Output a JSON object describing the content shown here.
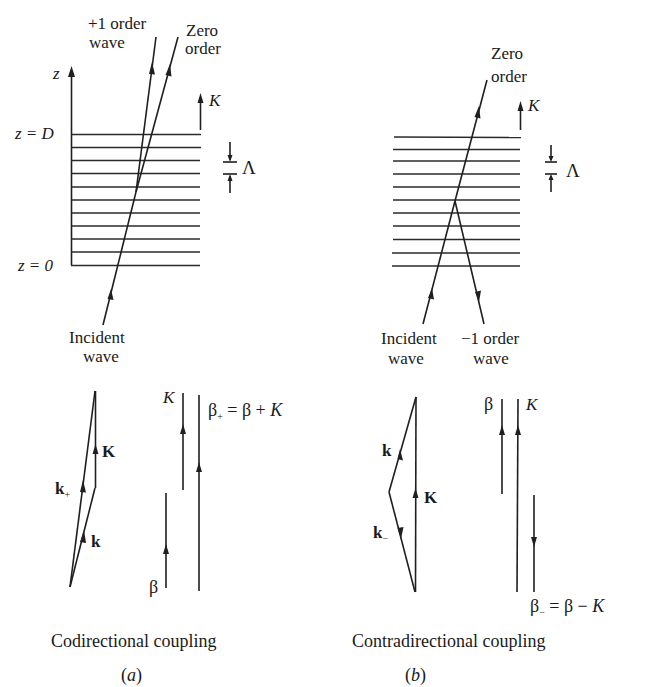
{
  "figure": {
    "panel_a": {
      "grating": {
        "axis_label": "z",
        "top_label": "z = D",
        "bottom_label": "z = 0",
        "grating_vector_label": "K",
        "period_label": "Λ",
        "line_count": 11
      },
      "rays": {
        "plus_one_label_line1": "+1 order",
        "plus_one_label_line2": "wave",
        "zero_label_line1": "Zero",
        "zero_label_line2": "order",
        "incident_label_line1": "Incident",
        "incident_label_line2": "wave"
      },
      "wavevector_diagram": {
        "K_label": "K",
        "k_plus_label": "k",
        "k_plus_sub": "+",
        "k_label": "k"
      },
      "propagation_constants": {
        "K_label": "K",
        "beta_label": "β",
        "beta_plus_eq": "β",
        "beta_plus_sub": "+",
        "beta_plus_rhs": " = β + ",
        "beta_plus_K": "K"
      },
      "caption": "Codirectional coupling",
      "tag": "(a)",
      "tag_open": "(",
      "tag_letter": "a",
      "tag_close": ")"
    },
    "panel_b": {
      "grating": {
        "grating_vector_label": "K",
        "period_label": "Λ",
        "line_count": 11
      },
      "rays": {
        "zero_label_line1": "Zero",
        "zero_label_line2": "order",
        "incident_label_line1": "Incident",
        "incident_label_line2": "wave",
        "minus_one_label_line1": "−1 order",
        "minus_one_label_line2": "wave"
      },
      "wavevector_diagram": {
        "k_label": "k",
        "K_label": "K",
        "k_minus_label": "k",
        "k_minus_sub": "−"
      },
      "propagation_constants": {
        "beta_label": "β",
        "K_label": "K",
        "beta_minus_eq": "β",
        "beta_minus_sub": "−",
        "beta_minus_rhs": " = β − ",
        "beta_minus_K": "K"
      },
      "caption": "Contradirectional coupling",
      "tag_open": "(",
      "tag_letter": "b",
      "tag_close": ")"
    },
    "colors": {
      "ink": "#1f1f1f",
      "background": "#ffffff"
    }
  }
}
